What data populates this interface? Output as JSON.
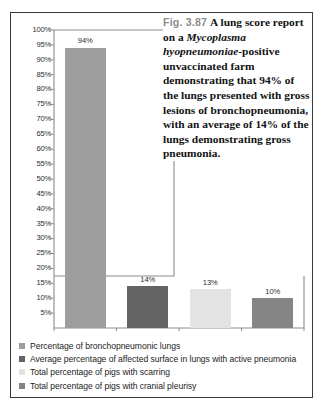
{
  "figure": {
    "caption": {
      "number": "Fig. 3.87",
      "text_before_species": "A lung score report on a ",
      "species": "Mycoplasma hyopneumoniae",
      "text_after_species": "-positive unvaccinated farm demonstrating that 94% of the lungs presented with gross lesions of bronchopneumonia, with an average of 14% of the lungs demonstrating gross pneumonia.",
      "number_color": "#8d8d8d",
      "text_color": "#131313"
    },
    "border_color": "#3a3a3a"
  },
  "chart_data": {
    "type": "bar",
    "title": "",
    "xlabel": "",
    "ylabel": "",
    "ylim": [
      0,
      100
    ],
    "grid": false,
    "legend_position": "bottom",
    "categories": [
      "Percentage of bronchopneumonic lungs",
      "Average percentage of affected surface in lungs with active pneumonia",
      "Total percentage of pigs with scarring",
      "Total percentage of pigs with cranial pleurisy"
    ],
    "values": [
      94,
      14,
      13,
      10
    ],
    "data_labels": [
      "94%",
      "14%",
      "13%",
      "10%"
    ],
    "colors": [
      "#9d9d9d",
      "#646464",
      "#e3e3e3",
      "#858585"
    ],
    "ytick_labels": [
      "100%",
      "95%",
      "90%",
      "85%",
      "80%",
      "75%",
      "70%",
      "65%",
      "60%",
      "55%",
      "50%",
      "45%",
      "40%",
      "35%",
      "30%",
      "25%",
      "20%",
      "15%",
      "10%",
      "5%"
    ],
    "ytick_values": [
      100,
      95,
      90,
      85,
      80,
      75,
      70,
      65,
      60,
      55,
      50,
      45,
      40,
      35,
      30,
      25,
      20,
      15,
      10,
      5
    ]
  },
  "legend": {
    "items": [
      {
        "label": "Percentage of bronchopneumonic lungs",
        "color": "#9d9d9d"
      },
      {
        "label": "Average percentage of affected surface in lungs with active pneumonia",
        "color": "#646464"
      },
      {
        "label": "Total percentage of pigs with scarring",
        "color": "#e3e3e3"
      },
      {
        "label": "Total percentage of pigs with cranial pleurisy",
        "color": "#858585"
      }
    ]
  }
}
